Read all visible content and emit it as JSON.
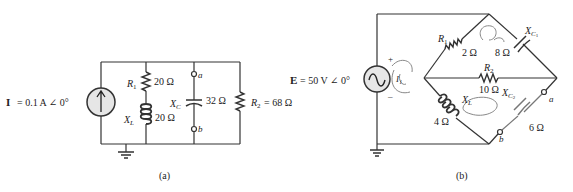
{
  "figure_a": {
    "caption": "(a)",
    "source": {
      "symbol": "I",
      "eq": "= 0.1 A ∠ 0°",
      "type": "current-source"
    },
    "R1": {
      "label": "R",
      "sub": "1",
      "value": "20 Ω"
    },
    "XL": {
      "label": "X",
      "sub": "L",
      "value": "20 Ω"
    },
    "XC": {
      "label": "X",
      "sub": "C",
      "value": "32 Ω"
    },
    "R2": {
      "label": "R",
      "sub": "2",
      "eq": "= 68 Ω"
    },
    "terminal_a": "a",
    "terminal_b": "b"
  },
  "figure_b": {
    "caption": "(b)",
    "source": {
      "symbol": "E",
      "eq": "= 50 V ∠ 0°",
      "type": "ac-voltage-source",
      "plus": "+",
      "minus": "–"
    },
    "R1": {
      "label": "R",
      "sub": "1",
      "value": "2 Ω"
    },
    "XC1": {
      "label": "X",
      "sub": "C",
      "subsub": "1",
      "value": "8 Ω"
    },
    "R2": {
      "label": "R",
      "sub": "2",
      "value": "10 Ω"
    },
    "XL": {
      "label": "X",
      "sub": "L",
      "value": "4 Ω"
    },
    "XC2": {
      "label": "X",
      "sub": "C",
      "subsub": "2",
      "value": "6 Ω"
    },
    "terminal_a": "a",
    "terminal_b": "b",
    "loop_label": "I₁"
  }
}
